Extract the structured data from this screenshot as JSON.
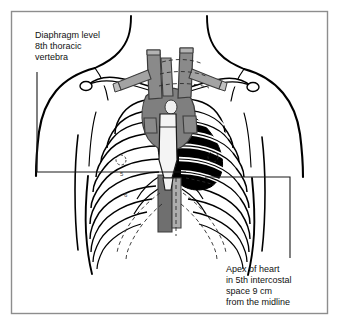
{
  "figure": {
    "frame": {
      "border_color": "#8d8d8d",
      "background_color": "#ffffff"
    },
    "palette": {
      "outline": "#000000",
      "heart_fill": "#000000",
      "vessel_gray": "#7f7f7f",
      "vessel_light_gray": "#a8a8a8",
      "vessel_dark_gray": "#5c5c5c",
      "sternum_fill": "#f2f2f2",
      "skin_fill": "#ffffff",
      "callout_line": "#1a1a1a",
      "dashed_line": "#2b2b2b"
    },
    "callouts": [
      {
        "name": "diaphragm-level-callout",
        "position": "top-left",
        "lines": [
          "Diaphragm level",
          "8th thoracic",
          "vertebra"
        ]
      },
      {
        "name": "apex-of-heart-callout",
        "position": "bottom-right",
        "lines": [
          "Apex of heart",
          "in 5th intercostal",
          "space 9 cm",
          "from the midline"
        ]
      }
    ],
    "rib_labels": [
      {
        "name": "rib-label-5",
        "text": "5",
        "x": 123,
        "y": 174
      },
      {
        "name": "rib-label-6",
        "text": "6",
        "x": 126,
        "y": 195
      }
    ],
    "markers": [
      {
        "name": "nipple-marker-left",
        "shape": "dashed-circle",
        "cx": 121,
        "cy": 160
      },
      {
        "name": "nipple-marker-right",
        "shape": "dashed-circle",
        "cx": 213,
        "cy": 157
      }
    ]
  }
}
